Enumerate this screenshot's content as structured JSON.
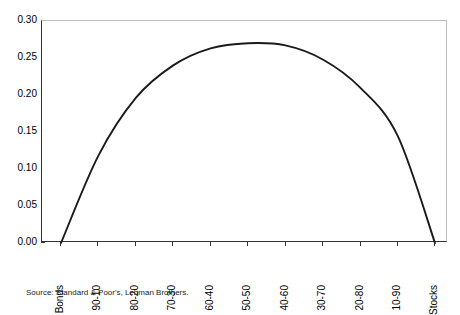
{
  "chart_data": {
    "type": "line",
    "title": "",
    "subtitle": "",
    "xlabel": "",
    "ylabel": "",
    "categories": [
      "Bonds",
      "90-10",
      "80-20",
      "70-30",
      "60-40",
      "50-50",
      "40-60",
      "30-70",
      "20-80",
      "10-90",
      "Stocks"
    ],
    "values": [
      0.0,
      0.118,
      0.196,
      0.24,
      0.263,
      0.27,
      0.267,
      0.248,
      0.21,
      0.145,
      0.0
    ],
    "series": [
      {
        "name": "Portfolio allocation curve",
        "values": [
          0.0,
          0.118,
          0.196,
          0.24,
          0.263,
          0.27,
          0.267,
          0.248,
          0.21,
          0.145,
          0.0
        ]
      }
    ],
    "ylim": [
      0.0,
      0.3
    ],
    "ytick_labels": [
      "0.30",
      "0.25",
      "0.20",
      "0.15",
      "0.10",
      "0.05",
      "0.00"
    ],
    "ytick_values": [
      0.3,
      0.25,
      0.2,
      0.15,
      0.1,
      0.05,
      0.0
    ],
    "ytick_step": 0.05,
    "grid": false,
    "legend": false,
    "legend_position": "none",
    "line_color": "#1a1a1a",
    "axis_color": "#333333",
    "frame_color": "#bdbdbd",
    "background_color": "#ffffff",
    "annotations": []
  },
  "source": {
    "note": "Source: Standard & Poor's, Lehman Brothers."
  }
}
